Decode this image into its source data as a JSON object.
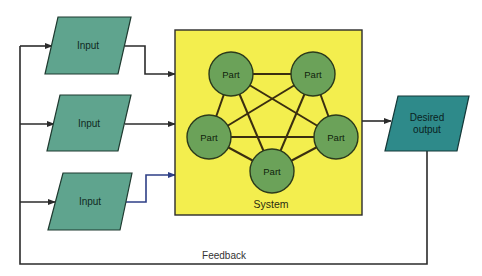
{
  "diagram": {
    "inputs": [
      {
        "label": "Input"
      },
      {
        "label": "Input"
      },
      {
        "label": "Input"
      }
    ],
    "system": {
      "label": "System",
      "parts": [
        {
          "label": "Part"
        },
        {
          "label": "Part"
        },
        {
          "label": "Part"
        },
        {
          "label": "Part"
        },
        {
          "label": "Part"
        }
      ]
    },
    "output": {
      "line1": "Desired",
      "line2": "output"
    },
    "feedback": {
      "label": "Feedback"
    }
  },
  "colors": {
    "input_fill": "#5fa48e",
    "system_fill": "#f3ee4e",
    "part_fill": "#6ba259",
    "output_fill": "#2e8a8a",
    "line": "#2b2b2b",
    "arrow_blue": "#2e3f86"
  }
}
